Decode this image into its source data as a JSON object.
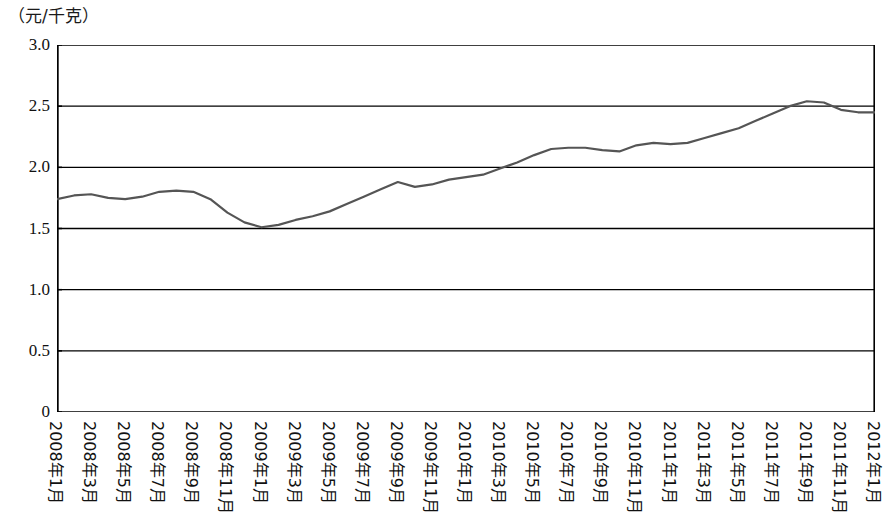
{
  "chart_data": {
    "type": "line",
    "title": "",
    "subtitle": "",
    "xlabel": "",
    "ylabel": "（元/千克）",
    "unit_label": "（元/千克）",
    "ylim": [
      0,
      3.0
    ],
    "ytick_labels": [
      "3.0",
      "2.5",
      "2.0",
      "1.5",
      "1.0",
      "0.5",
      "0"
    ],
    "ytick_values": [
      3.0,
      2.5,
      2.0,
      1.5,
      1.0,
      0.5,
      0
    ],
    "grid": true,
    "grid_axis": "y",
    "legend": null,
    "legend_position": "none",
    "line_color": "#555555",
    "axis_color": "#000000",
    "x": [
      "2008年1月",
      "2008年2月",
      "2008年3月",
      "2008年4月",
      "2008年5月",
      "2008年6月",
      "2008年7月",
      "2008年8月",
      "2008年9月",
      "2008年10月",
      "2008年11月",
      "2008年12月",
      "2009年1月",
      "2009年2月",
      "2009年3月",
      "2009年4月",
      "2009年5月",
      "2009年6月",
      "2009年7月",
      "2009年8月",
      "2009年9月",
      "2009年10月",
      "2009年11月",
      "2009年12月",
      "2010年1月",
      "2010年2月",
      "2010年3月",
      "2010年4月",
      "2010年5月",
      "2010年6月",
      "2010年7月",
      "2010年8月",
      "2010年9月",
      "2010年10月",
      "2010年11月",
      "2010年12月",
      "2011年1月",
      "2011年2月",
      "2011年3月",
      "2011年4月",
      "2011年5月",
      "2011年6月",
      "2011年7月",
      "2011年8月",
      "2011年9月",
      "2011年10月",
      "2011年11月",
      "2011年12月",
      "2012年1月"
    ],
    "xtick_labels_shown": [
      "2008年1月",
      "2008年3月",
      "2008年5月",
      "2008年7月",
      "2008年9月",
      "2008年11月",
      "2009年1月",
      "2009年3月",
      "2009年5月",
      "2009年7月",
      "2009年9月",
      "2009年11月",
      "2010年1月",
      "2010年3月",
      "2010年5月",
      "2010年7月",
      "2010年9月",
      "2010年11月",
      "2011年1月",
      "2011年3月",
      "2011年5月",
      "2011年7月",
      "2011年9月",
      "2011年11月",
      "2012年1月"
    ],
    "values": [
      1.74,
      1.77,
      1.78,
      1.75,
      1.74,
      1.76,
      1.8,
      1.81,
      1.8,
      1.74,
      1.63,
      1.55,
      1.51,
      1.53,
      1.57,
      1.6,
      1.64,
      1.7,
      1.76,
      1.82,
      1.88,
      1.84,
      1.86,
      1.9,
      1.92,
      1.94,
      1.99,
      2.04,
      2.1,
      2.15,
      2.16,
      2.16,
      2.14,
      2.13,
      2.18,
      2.2,
      2.19,
      2.2,
      2.24,
      2.28,
      2.32,
      2.38,
      2.44,
      2.5,
      2.54,
      2.53,
      2.47,
      2.45,
      2.45
    ]
  }
}
